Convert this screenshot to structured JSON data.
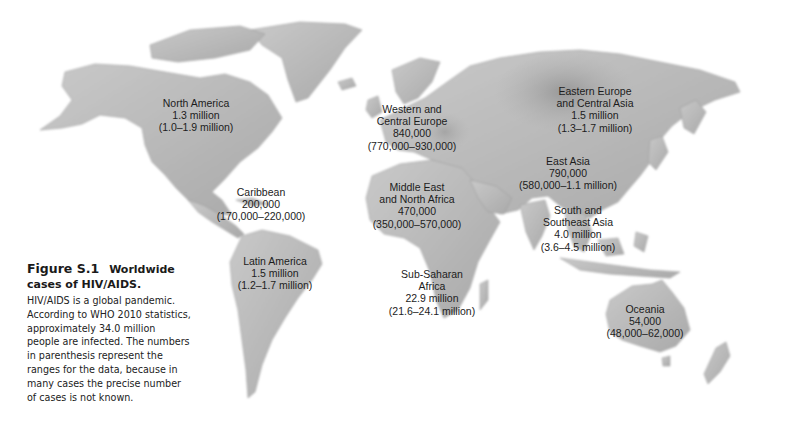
{
  "figure": {
    "number": "Figure S.1",
    "title_line1": "Worldwide",
    "title_line2": "cases of HIV/AIDS.",
    "caption_lines": [
      "HIV/AIDS is a global pandemic.",
      "According to WHO 2010 statistics,",
      "approximately 34.0 million",
      "people are infected. The numbers",
      "in parenthesis represent the",
      "ranges for the data, because in",
      "many cases the precise number",
      "of cases is not known."
    ]
  },
  "map": {
    "style": "grayscale shaded relief world map",
    "land_color": "#b8b8b8",
    "land_dark": "#8e8e8e",
    "ocean_color": "#ffffff",
    "regions": [
      {
        "name": "North America",
        "lines": [
          "North America",
          "1.3 million",
          "(1.0–1.9 million)"
        ],
        "x": 196,
        "y": 97
      },
      {
        "name": "Caribbean",
        "lines": [
          "Caribbean",
          "200,000",
          "(170,000–220,000)"
        ],
        "x": 261,
        "y": 186
      },
      {
        "name": "Latin America",
        "lines": [
          "Latin America",
          "1.5 million",
          "(1.2–1.7 million)"
        ],
        "x": 275,
        "y": 255
      },
      {
        "name": "Western and Central Europe",
        "lines": [
          "Western and",
          "Central Europe",
          "840,000",
          "(770,000–930,000)"
        ],
        "x": 412,
        "y": 103
      },
      {
        "name": "Middle East and North Africa",
        "lines": [
          "Middle East",
          "and North Africa",
          "470,000",
          "(350,000–570,000)"
        ],
        "x": 417,
        "y": 181
      },
      {
        "name": "Sub-Saharan Africa",
        "lines": [
          "Sub-Saharan",
          "Africa",
          "22.9 million",
          "(21.6–24.1 million)"
        ],
        "x": 432,
        "y": 268
      },
      {
        "name": "Eastern Europe and Central Asia",
        "lines": [
          "Eastern Europe",
          "and Central Asia",
          "1.5 million",
          "(1.3–1.7 million)"
        ],
        "x": 595,
        "y": 85
      },
      {
        "name": "East Asia",
        "lines": [
          "East Asia",
          "790,000",
          "(580,000–1.1 million)"
        ],
        "x": 568,
        "y": 155
      },
      {
        "name": "South and Southeast Asia",
        "lines": [
          "South and",
          "Southeast Asia",
          "4.0 million",
          "(3.6–4.5 million)"
        ],
        "x": 578,
        "y": 204
      },
      {
        "name": "Oceania",
        "lines": [
          "Oceania",
          "54,000",
          "(48,000–62,000)"
        ],
        "x": 645,
        "y": 303
      }
    ]
  }
}
